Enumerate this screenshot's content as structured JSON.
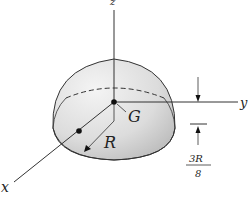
{
  "figure": {
    "type": "hemisphere-centroid-diagram",
    "axes": {
      "x": "x",
      "y": "y",
      "z": "z"
    },
    "labels": {
      "centroid": "G",
      "radius": "R",
      "dimension_numerator": "3R",
      "dimension_denominator": "8"
    },
    "colors": {
      "line": "#333333",
      "fill_light": "#f2f2f2",
      "fill_dark": "#c8c8c8"
    }
  }
}
